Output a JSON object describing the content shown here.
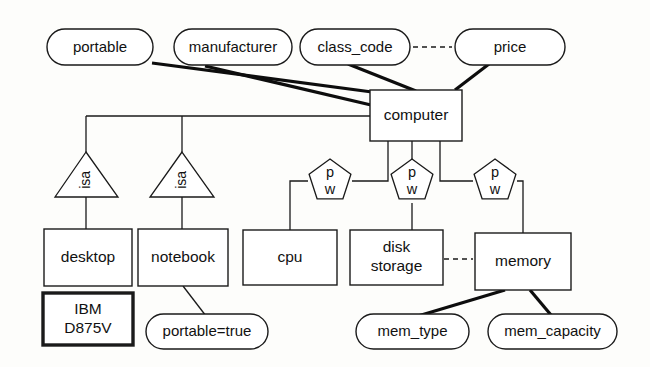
{
  "diagram": {
    "type": "entity-relationship-diagram",
    "colors": {
      "background": "#fdfdfb",
      "stroke": "#1a1a1a",
      "thick_stroke": "#0d0d0d",
      "fill": "#ffffff",
      "text": "#111111"
    },
    "entities": [
      {
        "id": "computer",
        "label": "computer",
        "x": 370,
        "y": 90,
        "w": 92,
        "h": 51,
        "strong": false,
        "lines": [
          "computer"
        ]
      },
      {
        "id": "desktop",
        "label": "desktop",
        "x": 44,
        "y": 229,
        "w": 88,
        "h": 57,
        "strong": false,
        "lines": [
          "desktop"
        ]
      },
      {
        "id": "notebook",
        "label": "notebook",
        "x": 138,
        "y": 229,
        "w": 90,
        "h": 57,
        "strong": false,
        "lines": [
          "notebook"
        ]
      },
      {
        "id": "ibm",
        "label": "IBM D875V",
        "x": 43,
        "y": 293,
        "w": 90,
        "h": 52,
        "strong": true,
        "lines": [
          "IBM",
          "D875V"
        ]
      },
      {
        "id": "cpu",
        "label": "cpu",
        "x": 243,
        "y": 230,
        "w": 94,
        "h": 55,
        "strong": false,
        "lines": [
          "cpu"
        ]
      },
      {
        "id": "diskstorage",
        "label": "disk storage",
        "x": 350,
        "y": 230,
        "w": 93,
        "h": 55,
        "strong": false,
        "lines": [
          "disk",
          "storage"
        ]
      },
      {
        "id": "memory",
        "label": "memory",
        "x": 475,
        "y": 233,
        "w": 96,
        "h": 57,
        "strong": false,
        "lines": [
          "memory"
        ]
      }
    ],
    "attributes": [
      {
        "id": "portable",
        "label": "portable",
        "x": 47,
        "y": 29,
        "w": 106,
        "h": 36
      },
      {
        "id": "manufacturer",
        "label": "manufacturer",
        "x": 174,
        "y": 29,
        "w": 118,
        "h": 36
      },
      {
        "id": "class_code",
        "label": "class_code",
        "x": 300,
        "y": 29,
        "w": 110,
        "h": 36
      },
      {
        "id": "price",
        "label": "price",
        "x": 455,
        "y": 29,
        "w": 110,
        "h": 36
      },
      {
        "id": "portable_true",
        "label": "portable=true",
        "x": 146,
        "y": 314,
        "w": 122,
        "h": 35
      },
      {
        "id": "mem_type",
        "label": "mem_type",
        "x": 356,
        "y": 314,
        "w": 113,
        "h": 35
      },
      {
        "id": "mem_capacity",
        "label": "mem_capacity",
        "x": 488,
        "y": 314,
        "w": 129,
        "h": 35
      }
    ],
    "isa_triangles": [
      {
        "id": "isa-desktop",
        "label": "isa",
        "apex_x": 86,
        "apex_y": 152,
        "left_x": 55,
        "right_x": 118,
        "base_y": 197
      },
      {
        "id": "isa-notebook",
        "label": "isa",
        "apex_x": 182,
        "apex_y": 152,
        "left_x": 150,
        "right_x": 214,
        "base_y": 197
      }
    ],
    "pentagons": [
      {
        "id": "pw-cpu",
        "top_label": "p",
        "bottom_label": "w",
        "cx": 330,
        "cy": 181,
        "r": 22
      },
      {
        "id": "pw-disk",
        "top_label": "p",
        "bottom_label": "w",
        "cx": 412,
        "cy": 181,
        "r": 22
      },
      {
        "id": "pw-memory",
        "top_label": "p",
        "bottom_label": "w",
        "cx": 495,
        "cy": 181,
        "r": 22
      }
    ],
    "connectors": [
      {
        "id": "link-portable-computer",
        "style": "thick",
        "points": "152,63 372,92"
      },
      {
        "id": "link-manufacturer-computer",
        "style": "thick",
        "points": "205,66 371,105"
      },
      {
        "id": "link-class_code-computer",
        "style": "thick",
        "points": "348,64 416,91"
      },
      {
        "id": "link-price-computer",
        "style": "thick",
        "points": "489,64 455,90"
      },
      {
        "id": "link-classcode-price-dash",
        "style": "dashed",
        "points": "413,47 452,47"
      },
      {
        "id": "link-computer-hierarchy",
        "style": "thin",
        "points": "370,116 86,116"
      },
      {
        "id": "link-isa-desktop-drop",
        "style": "thin",
        "points": "86,116 86,152"
      },
      {
        "id": "link-isa-notebook-drop",
        "style": "thin",
        "points": "182,116 182,152"
      },
      {
        "id": "link-desktop-isa",
        "style": "thin",
        "points": "86,197 86,229"
      },
      {
        "id": "link-notebook-isa",
        "style": "thin",
        "points": "182,197 182,229"
      },
      {
        "id": "link-notebook-portabletrue",
        "style": "thin",
        "points": "183,286 206,316"
      },
      {
        "id": "link-computer-cpu-a",
        "style": "thin",
        "points": "388,141 388,181 352,181"
      },
      {
        "id": "link-cpu-pent",
        "style": "thin",
        "points": "308,181 290,181 290,230"
      },
      {
        "id": "link-computer-disk",
        "style": "thin",
        "points": "412,141 412,159"
      },
      {
        "id": "link-disk-pent",
        "style": "thin",
        "points": "412,203 412,230"
      },
      {
        "id": "link-computer-mem-a",
        "style": "thin",
        "points": "440,141 440,181 473,181"
      },
      {
        "id": "link-mem-pent",
        "style": "thin",
        "points": "517,181 523,181 523,233"
      },
      {
        "id": "link-disk-memory-dash",
        "style": "dashed",
        "points": "444,259 473,259"
      },
      {
        "id": "link-memory-memtype",
        "style": "thick",
        "points": "505,290 418,316"
      },
      {
        "id": "link-memory-memcapacity",
        "style": "thick",
        "points": "530,290 551,315"
      }
    ]
  }
}
